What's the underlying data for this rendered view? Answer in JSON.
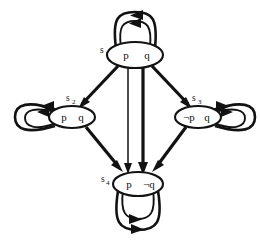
{
  "diagram": {
    "type": "kripke-structure",
    "colors": {
      "stroke": "#121212",
      "fill": "#ffffff",
      "background": "#ffffff"
    },
    "nodes": [
      {
        "id": "s1",
        "state_label": "s",
        "state_subscript": "1",
        "proposition_left": "p",
        "proposition_right": "q",
        "cx": 135,
        "cy": 55,
        "rx": 28,
        "ry": 13,
        "label_x": 100,
        "label_y": 52,
        "self_loop": "top"
      },
      {
        "id": "s2",
        "state_label": "s",
        "state_subscript": "2",
        "proposition_left": "p",
        "proposition_right": "q",
        "cx": 72,
        "cy": 117,
        "rx": 23,
        "ry": 11,
        "label_x": 72,
        "label_y": 100,
        "self_loop": "left"
      },
      {
        "id": "s3",
        "state_label": "s",
        "state_subscript": "3",
        "proposition_left": "¬p",
        "proposition_right": "q",
        "cx": 198,
        "cy": 117,
        "rx": 23,
        "ry": 11,
        "label_x": 196,
        "label_y": 100,
        "self_loop": "right"
      },
      {
        "id": "s4",
        "state_label": "s",
        "state_subscript": "4",
        "proposition_left": "p",
        "proposition_right": "¬q",
        "cx": 138,
        "cy": 184,
        "rx": 25,
        "ry": 12,
        "label_x": 104,
        "label_y": 181,
        "self_loop": "bottom"
      }
    ],
    "transitions": [
      {
        "from": "s1",
        "to": "s2",
        "style": "thick"
      },
      {
        "from": "s1",
        "to": "s3",
        "style": "thick"
      },
      {
        "from": "s1",
        "to": "s4",
        "style": "thin",
        "variant": "left-parallel"
      },
      {
        "from": "s1",
        "to": "s4",
        "style": "thick",
        "variant": "right-parallel"
      },
      {
        "from": "s2",
        "to": "s4",
        "style": "thick"
      },
      {
        "from": "s3",
        "to": "s4",
        "style": "thick"
      },
      {
        "from": "s1",
        "to": "s1",
        "style": "thick",
        "variant": "self-outer"
      },
      {
        "from": "s1",
        "to": "s1",
        "style": "thin",
        "variant": "self-inner"
      },
      {
        "from": "s2",
        "to": "s2",
        "style": "thick",
        "variant": "self-outer"
      },
      {
        "from": "s2",
        "to": "s2",
        "style": "thin",
        "variant": "self-inner"
      },
      {
        "from": "s3",
        "to": "s3",
        "style": "thick",
        "variant": "self-outer"
      },
      {
        "from": "s3",
        "to": "s3",
        "style": "thin",
        "variant": "self-inner"
      },
      {
        "from": "s4",
        "to": "s4",
        "style": "thick",
        "variant": "self-outer"
      },
      {
        "from": "s4",
        "to": "s4",
        "style": "thin",
        "variant": "self-inner"
      }
    ]
  }
}
